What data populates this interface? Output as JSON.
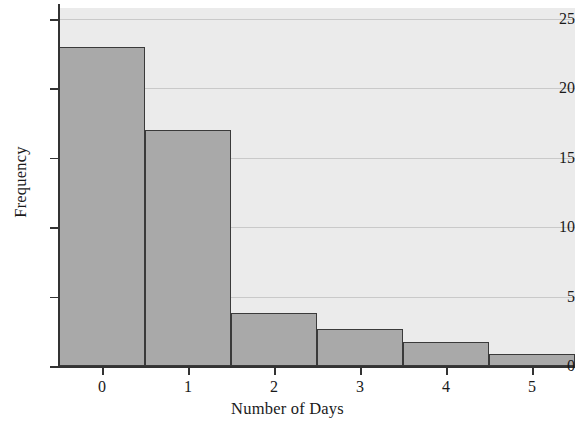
{
  "chart_data": {
    "type": "bar",
    "title": "",
    "subtitle": "",
    "xlabel": "Number of Days",
    "ylabel": "Frequency",
    "categories": [
      "0",
      "1",
      "2",
      "3",
      "4",
      "5"
    ],
    "values": [
      23,
      17,
      3.8,
      2.7,
      1.7,
      0.9
    ],
    "series": [
      {
        "name": "Frequency",
        "values": [
          23,
          17,
          3.8,
          2.7,
          1.7,
          0.9
        ]
      }
    ],
    "xlim": [
      -0.5,
      5.5
    ],
    "ylim": [
      0,
      25.8
    ],
    "x_ticks": [
      "0",
      "1",
      "2",
      "3",
      "4",
      "5"
    ],
    "y_ticks": [
      "0",
      "5",
      "10",
      "15",
      "20",
      "25"
    ],
    "y_tick_values": [
      0,
      5,
      10,
      15,
      20,
      25
    ],
    "grid": "horizontal",
    "legend": "none",
    "colors": {
      "bar_fill": "#a9a9a9",
      "bar_edge": "#3a3a3a",
      "plot_background": "#ebebeb",
      "gridline": "#c9c9c9",
      "axis": "#333333",
      "text": "#1a1a1a"
    },
    "annotations": []
  }
}
